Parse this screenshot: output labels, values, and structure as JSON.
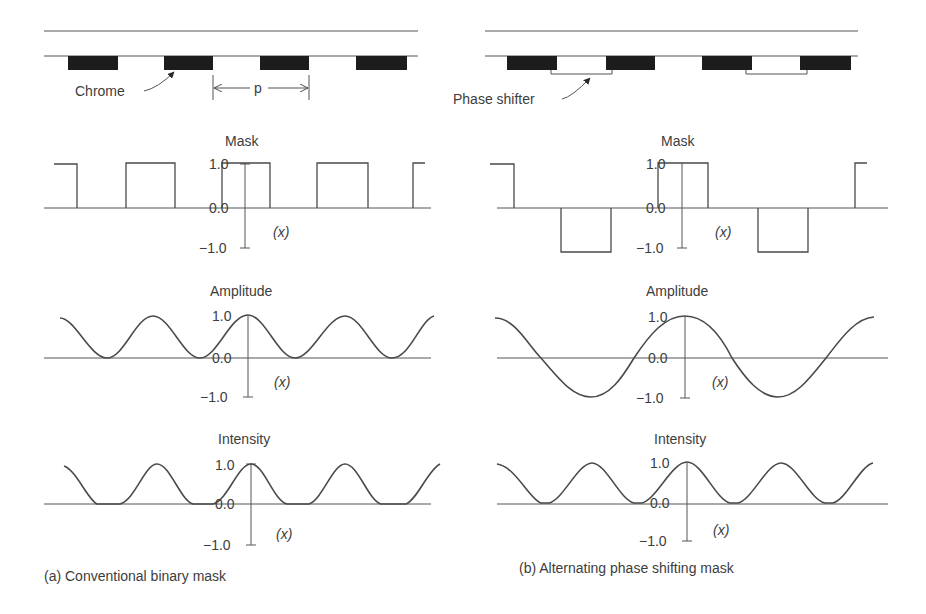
{
  "panels": {
    "left": {
      "caption": "(a) Conventional binary mask",
      "chrome_label": "Chrome",
      "pitch_label": "p",
      "mask_title": "Mask",
      "amplitude_title": "Amplitude",
      "intensity_title": "Intensity"
    },
    "right": {
      "caption": "(b) Alternating phase shifting mask",
      "phase_shifter_label": "Phase shifter",
      "mask_title": "Mask",
      "amplitude_title": "Amplitude",
      "intensity_title": "Intensity"
    }
  },
  "axis": {
    "top_tick": "1.0",
    "zero_tick": "0.0",
    "bottom_tick": "−1.0",
    "x_label": "(x)"
  },
  "colors": {
    "line": "#4a4a4a",
    "chrome": "#1c1c1c",
    "background": "#ffffff"
  }
}
